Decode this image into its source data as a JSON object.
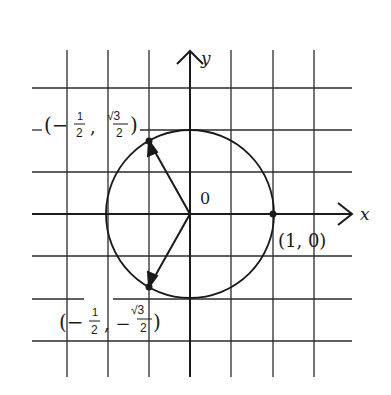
{
  "diagram": {
    "type": "unit-circle",
    "colors": {
      "ink": "#1a1a1a",
      "grid": "#2b2b2b",
      "background": "#ffffff"
    },
    "axes": {
      "x_label": "x",
      "y_label": "y",
      "origin_label": "0"
    },
    "grid": {
      "cell_units": 0.5,
      "x_range": [
        -2,
        2
      ],
      "y_range": [
        -2,
        2
      ]
    },
    "circle": {
      "center": [
        0,
        0
      ],
      "radius": 1
    },
    "points": [
      {
        "name": "point-1-0",
        "coords": [
          1,
          0
        ],
        "label": "(1, 0)"
      },
      {
        "name": "point-upper",
        "coords": [
          -0.5,
          0.866
        ],
        "label_prefix": "(−",
        "label_num": "1",
        "label_den": "2",
        "label_mid": ",",
        "label_num2": "√3",
        "label_den2": "2",
        "label_suffix": ")"
      },
      {
        "name": "point-lower",
        "coords": [
          -0.5,
          -0.866
        ],
        "label_prefix": "(−",
        "label_num": "1",
        "label_den": "2",
        "label_mid": ", −",
        "label_num2": "√3",
        "label_den2": "2",
        "label_suffix": ")"
      }
    ],
    "vectors": [
      {
        "from": [
          0,
          0
        ],
        "to": [
          -0.5,
          0.866
        ]
      },
      {
        "from": [
          0,
          0
        ],
        "to": [
          -0.5,
          -0.866
        ]
      }
    ]
  }
}
